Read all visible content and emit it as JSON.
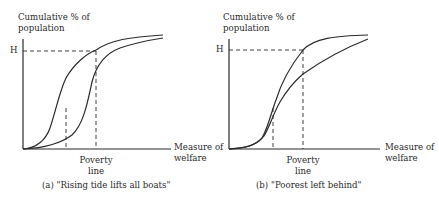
{
  "panels": [
    {
      "y_label_line1": "Cumulative % of",
      "y_label_line2": "population",
      "h_label": "H",
      "x_label_line1": "Measure of",
      "x_label_line2": "welfare",
      "poverty_label_line1": "Poverty",
      "poverty_label_line2": "line",
      "caption": "(a) \"Rising tide lifts all boats\""
    },
    {
      "y_label_line1": "Cumulative % of",
      "y_label_line2": "population",
      "h_label": "H",
      "x_label_line1": "Measure of",
      "x_label_line2": "welfare",
      "poverty_label_line1": "Poverty",
      "poverty_label_line2": "line",
      "caption": "(b) \"Poorest left behind\""
    }
  ],
  "colors": {
    "line": "#2a2a2a",
    "background": "#ffffff"
  }
}
